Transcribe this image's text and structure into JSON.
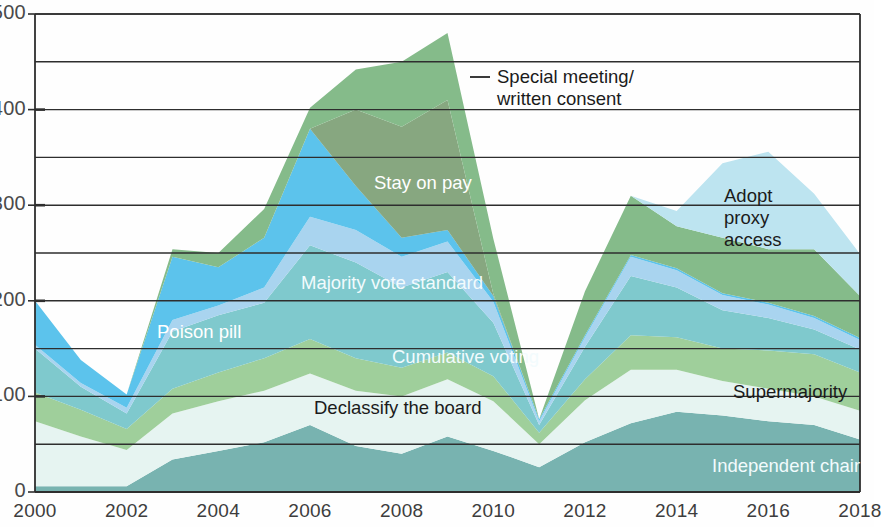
{
  "chart_data": {
    "type": "area",
    "stacked": true,
    "title": "",
    "subtitle": "",
    "xlabel": "",
    "ylabel": "",
    "grid": true,
    "legend_position": "inline-annotations",
    "x": [
      2000,
      2001,
      2002,
      2003,
      2004,
      2005,
      2006,
      2007,
      2008,
      2009,
      2010,
      2011,
      2012,
      2013,
      2014,
      2015,
      2016,
      2017,
      2018
    ],
    "xlim": [
      2000,
      2018
    ],
    "ylim": [
      0,
      500
    ],
    "ytick_labels": [
      "0",
      "100",
      "200",
      "300",
      "400",
      "500"
    ],
    "ytick_values": [
      0,
      100,
      200,
      300,
      400,
      500
    ],
    "yminor_values": [
      50,
      150,
      250,
      350,
      450
    ],
    "xtick_labels": [
      "2000",
      "2002",
      "2004",
      "2006",
      "2008",
      "2010",
      "2012",
      "2014",
      "2016",
      "2018"
    ],
    "xtick_values": [
      2000,
      2002,
      2004,
      2006,
      2008,
      2010,
      2012,
      2014,
      2016,
      2018
    ],
    "series": [
      {
        "name": "Independent chair",
        "color": "#78b3b0",
        "values": [
          6,
          6,
          6,
          34,
          43,
          52,
          70,
          48,
          40,
          58,
          43,
          26,
          52,
          72,
          84,
          80,
          74,
          70,
          55
        ]
      },
      {
        "name": "Declassify the board",
        "color": "#e6f4f1",
        "values": [
          68,
          52,
          38,
          48,
          52,
          54,
          54,
          58,
          60,
          60,
          52,
          24,
          44,
          56,
          44,
          36,
          34,
          30,
          30
        ]
      },
      {
        "name": "Cumulative voting",
        "color": "#9fcf9b",
        "values": [
          30,
          28,
          22,
          26,
          30,
          34,
          36,
          34,
          30,
          28,
          26,
          12,
          22,
          36,
          34,
          34,
          40,
          44,
          40
        ]
      },
      {
        "name": "Majority vote standard",
        "color": "#7fc9cd",
        "values": [
          46,
          24,
          16,
          60,
          60,
          58,
          98,
          100,
          84,
          84,
          56,
          8,
          34,
          62,
          52,
          40,
          34,
          26,
          24
        ]
      },
      {
        "name": "Supermajority",
        "color": "#a9d4ef",
        "values": [
          4,
          4,
          6,
          12,
          10,
          16,
          30,
          34,
          32,
          32,
          22,
          4,
          10,
          20,
          18,
          16,
          14,
          12,
          10
        ]
      },
      {
        "name": "Poison pill",
        "color": "#5cc3ec",
        "values": [
          46,
          24,
          14,
          66,
          40,
          52,
          92,
          46,
          20,
          12,
          6,
          2,
          2,
          2,
          2,
          2,
          2,
          2,
          2
        ]
      },
      {
        "name": "Stay on pay",
        "color": "#6d9464",
        "values": [
          0,
          0,
          0,
          0,
          0,
          0,
          0,
          80,
          116,
          136,
          2,
          0,
          0,
          0,
          0,
          0,
          0,
          0,
          0
        ]
      },
      {
        "name": "Special meeting/ written consent",
        "color": "#85bb8a",
        "values": [
          0,
          0,
          0,
          8,
          15,
          30,
          22,
          42,
          68,
          70,
          58,
          0,
          46,
          62,
          44,
          58,
          56,
          70,
          44
        ]
      },
      {
        "name": "Adopt proxy access",
        "color": "#bde4f0",
        "values": [
          0,
          0,
          0,
          0,
          0,
          0,
          0,
          0,
          0,
          0,
          0,
          0,
          0,
          0,
          16,
          78,
          102,
          58,
          44
        ]
      }
    ],
    "annotations": [
      {
        "id": "special-meeting",
        "text": "Special meeting/\nwritten consent",
        "style": "dark",
        "x": 497,
        "y": 66
      },
      {
        "id": "stay-on-pay",
        "text": "Stay on pay",
        "style": "light",
        "x": 374,
        "y": 172
      },
      {
        "id": "adopt-proxy-access",
        "text": "Adopt\nproxy\naccess",
        "style": "dark",
        "x": 724,
        "y": 185
      },
      {
        "id": "majority-vote-standard",
        "text": "Majority vote standard",
        "style": "light-faint",
        "x": 301,
        "y": 272
      },
      {
        "id": "poison-pill",
        "text": "Poison pill",
        "style": "light",
        "x": 157,
        "y": 321
      },
      {
        "id": "cumulative-voting",
        "text": "Cumulative voting",
        "style": "light-faint",
        "x": 392,
        "y": 346
      },
      {
        "id": "supermajority",
        "text": "Supermajority",
        "style": "dark",
        "x": 733,
        "y": 381
      },
      {
        "id": "declassify-the-board",
        "text": "Declassify the board",
        "style": "dark",
        "x": 314,
        "y": 397
      },
      {
        "id": "independent-chair",
        "text": "Independent chair",
        "style": "light-faint",
        "x": 712,
        "y": 455
      }
    ]
  }
}
